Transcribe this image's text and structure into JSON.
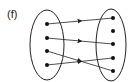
{
  "label": "(f)",
  "domain_set": {
    "points": [
      {
        "x": 47,
        "y": 24
      },
      {
        "x": 47,
        "y": 38
      },
      {
        "x": 47,
        "y": 51
      },
      {
        "x": 47,
        "y": 65
      }
    ],
    "ellipse": {
      "cx": 47,
      "cy": 45,
      "rx": 17,
      "ry": 35
    }
  },
  "codomain_set": {
    "points": [
      {
        "x": 113,
        "y": 18
      },
      {
        "x": 113,
        "y": 31
      },
      {
        "x": 113,
        "y": 44
      },
      {
        "x": 113,
        "y": 58
      },
      {
        "x": 113,
        "y": 71
      }
    ],
    "ellipse": {
      "cx": 111,
      "cy": 45,
      "rx": 15,
      "ry": 36
    }
  },
  "mappings": [
    {
      "from": 0,
      "to": 0
    },
    {
      "from": 1,
      "to": 2
    },
    {
      "from": 2,
      "to": 4
    },
    {
      "from": 3,
      "to": 3
    }
  ],
  "colors": {
    "stroke": "#222222",
    "point": "#111111"
  }
}
